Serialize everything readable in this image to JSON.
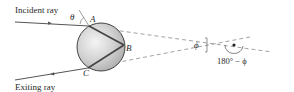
{
  "diagram": {
    "labels": {
      "incident_ray": "Incident ray",
      "exiting_ray": "Exiting ray",
      "theta": "θ",
      "point_a": "A",
      "point_b": "B",
      "point_c": "C",
      "phi": "ϕ",
      "supplementary_angle": "180° − ϕ"
    },
    "colors": {
      "ray": "#555555",
      "sphere_fill": "#c8c8c8",
      "sphere_highlight": "#f2f2f2",
      "sphere_edge": "#444444",
      "dashed": "#8a8a8a",
      "text": "#2a2a2a"
    }
  }
}
